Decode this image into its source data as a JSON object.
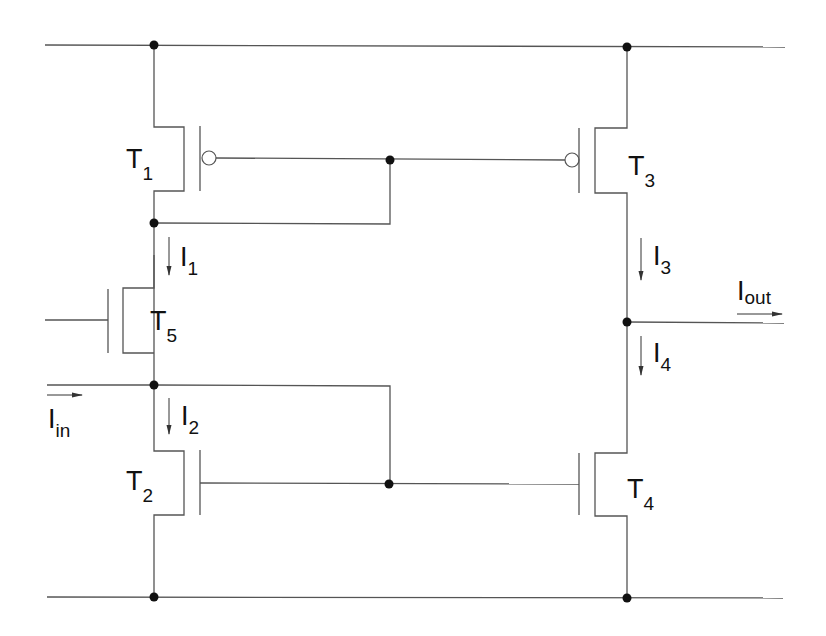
{
  "diagram": {
    "type": "circuit-schematic",
    "colors": {
      "wire": "#555555",
      "node": "#111111",
      "background": "#ffffff"
    },
    "transistors": [
      {
        "id": "T1",
        "main": "T",
        "sub": "1",
        "polarity": "p-channel"
      },
      {
        "id": "T2",
        "main": "T",
        "sub": "2",
        "polarity": "n-channel"
      },
      {
        "id": "T3",
        "main": "T",
        "sub": "3",
        "polarity": "p-channel"
      },
      {
        "id": "T4",
        "main": "T",
        "sub": "4",
        "polarity": "n-channel"
      },
      {
        "id": "T5",
        "main": "T",
        "sub": "5",
        "polarity": "n-channel"
      }
    ],
    "currents": [
      {
        "id": "I1",
        "main": "I",
        "sub": "1"
      },
      {
        "id": "I2",
        "main": "I",
        "sub": "2"
      },
      {
        "id": "I3",
        "main": "I",
        "sub": "3"
      },
      {
        "id": "I4",
        "main": "I",
        "sub": "4"
      },
      {
        "id": "Iin",
        "main": "I",
        "sub": "in"
      },
      {
        "id": "Iout",
        "main": "I",
        "sub": "out"
      }
    ]
  }
}
